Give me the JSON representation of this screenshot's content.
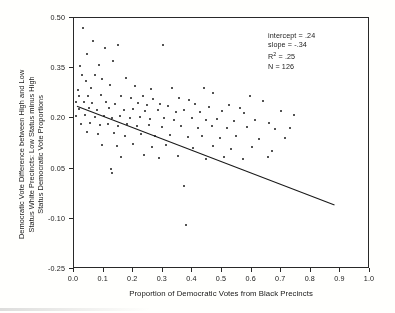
{
  "chart_data": {
    "type": "scatter",
    "title": "",
    "xlabel": "Proportion of Democratic Votes from Black Precincts",
    "ylabel": "Democratic Vote Difference between High and Low Status White Precincts: Low Status minus High Status Democratic Vote Proportions",
    "ylabel_lines": [
      "Democratic Vote Difference between High and Low",
      "Status White Precincts: Low Status minus High",
      "Status Democratic Vote Proportions"
    ],
    "xlim": [
      0.0,
      1.0
    ],
    "ylim": [
      -0.25,
      0.5
    ],
    "xticks": [
      0.0,
      0.1,
      0.2,
      0.3,
      0.4,
      0.5,
      0.6,
      0.7,
      0.8,
      0.9,
      1.0
    ],
    "xtick_labels": [
      "0.0",
      "0.1",
      "0.2",
      "0.3",
      "0.4",
      "0.5",
      "0.6",
      "0.7",
      "0.8",
      "0.9",
      "1.0"
    ],
    "yticks": [
      0.5,
      0.35,
      0.2,
      0.05,
      -0.1,
      -0.25
    ],
    "ytick_labels": [
      "0.50",
      "0.35",
      "0.20",
      "0.05",
      "-0.10",
      "-0.25"
    ],
    "grid": false,
    "legend": false,
    "marker_color": "#1b1b1b",
    "line_color": "#1b1b1b",
    "regression_line": {
      "intercept": 0.24,
      "slope": -0.34,
      "x_start": 0.01,
      "x_end": 0.88,
      "y_start": 0.236,
      "y_end": -0.059
    },
    "annotations": {
      "intercept_label": "intercept = .24",
      "slope_label": "slope = -.34",
      "r2_label_prefix": "R",
      "r2_label_sup": "2",
      "r2_label_suffix": " = .25",
      "n_label": "N = 126"
    },
    "n_points": 126,
    "points": [
      [
        0.03,
        0.47
      ],
      [
        0.045,
        0.392
      ],
      [
        0.065,
        0.432
      ],
      [
        0.105,
        0.41
      ],
      [
        0.15,
        0.418
      ],
      [
        0.3,
        0.418
      ],
      [
        0.02,
        0.356
      ],
      [
        0.085,
        0.36
      ],
      [
        0.132,
        0.372
      ],
      [
        0.026,
        0.33
      ],
      [
        0.07,
        0.33
      ],
      [
        0.04,
        0.312
      ],
      [
        0.096,
        0.318
      ],
      [
        0.175,
        0.322
      ],
      [
        0.122,
        0.3
      ],
      [
        0.205,
        0.296
      ],
      [
        0.012,
        0.286
      ],
      [
        0.057,
        0.29
      ],
      [
        0.26,
        0.288
      ],
      [
        0.33,
        0.29
      ],
      [
        0.438,
        0.292
      ],
      [
        0.47,
        0.276
      ],
      [
        0.018,
        0.268
      ],
      [
        0.048,
        0.266
      ],
      [
        0.09,
        0.27
      ],
      [
        0.16,
        0.268
      ],
      [
        0.192,
        0.262
      ],
      [
        0.232,
        0.268
      ],
      [
        0.268,
        0.258
      ],
      [
        0.355,
        0.262
      ],
      [
        0.39,
        0.256
      ],
      [
        0.596,
        0.268
      ],
      [
        0.64,
        0.252
      ],
      [
        0.008,
        0.248
      ],
      [
        0.034,
        0.25
      ],
      [
        0.062,
        0.246
      ],
      [
        0.108,
        0.248
      ],
      [
        0.14,
        0.244
      ],
      [
        0.215,
        0.246
      ],
      [
        0.248,
        0.24
      ],
      [
        0.292,
        0.244
      ],
      [
        0.318,
        0.236
      ],
      [
        0.41,
        0.242
      ],
      [
        0.455,
        0.234
      ],
      [
        0.525,
        0.24
      ],
      [
        0.56,
        0.23
      ],
      [
        0.016,
        0.228
      ],
      [
        0.052,
        0.232
      ],
      [
        0.078,
        0.226
      ],
      [
        0.118,
        0.23
      ],
      [
        0.168,
        0.224
      ],
      [
        0.2,
        0.228
      ],
      [
        0.24,
        0.222
      ],
      [
        0.285,
        0.226
      ],
      [
        0.345,
        0.22
      ],
      [
        0.372,
        0.224
      ],
      [
        0.425,
        0.218
      ],
      [
        0.5,
        0.222
      ],
      [
        0.575,
        0.216
      ],
      [
        0.7,
        0.222
      ],
      [
        0.742,
        0.21
      ],
      [
        0.006,
        0.206
      ],
      [
        0.038,
        0.21
      ],
      [
        0.072,
        0.204
      ],
      [
        0.1,
        0.208
      ],
      [
        0.128,
        0.202
      ],
      [
        0.156,
        0.206
      ],
      [
        0.188,
        0.2
      ],
      [
        0.222,
        0.204
      ],
      [
        0.258,
        0.198
      ],
      [
        0.305,
        0.202
      ],
      [
        0.338,
        0.196
      ],
      [
        0.398,
        0.2
      ],
      [
        0.445,
        0.194
      ],
      [
        0.482,
        0.198
      ],
      [
        0.54,
        0.192
      ],
      [
        0.612,
        0.196
      ],
      [
        0.66,
        0.186
      ],
      [
        0.024,
        0.182
      ],
      [
        0.055,
        0.186
      ],
      [
        0.088,
        0.18
      ],
      [
        0.115,
        0.184
      ],
      [
        0.148,
        0.178
      ],
      [
        0.18,
        0.182
      ],
      [
        0.212,
        0.176
      ],
      [
        0.252,
        0.18
      ],
      [
        0.296,
        0.174
      ],
      [
        0.362,
        0.178
      ],
      [
        0.418,
        0.172
      ],
      [
        0.465,
        0.176
      ],
      [
        0.518,
        0.17
      ],
      [
        0.585,
        0.174
      ],
      [
        0.68,
        0.168
      ],
      [
        0.73,
        0.172
      ],
      [
        0.044,
        0.158
      ],
      [
        0.082,
        0.152
      ],
      [
        0.136,
        0.156
      ],
      [
        0.172,
        0.148
      ],
      [
        0.228,
        0.152
      ],
      [
        0.275,
        0.146
      ],
      [
        0.325,
        0.15
      ],
      [
        0.385,
        0.144
      ],
      [
        0.432,
        0.148
      ],
      [
        0.492,
        0.142
      ],
      [
        0.548,
        0.146
      ],
      [
        0.625,
        0.138
      ],
      [
        0.712,
        0.142
      ],
      [
        0.095,
        0.122
      ],
      [
        0.145,
        0.118
      ],
      [
        0.198,
        0.124
      ],
      [
        0.262,
        0.116
      ],
      [
        0.312,
        0.12
      ],
      [
        0.402,
        0.112
      ],
      [
        0.47,
        0.118
      ],
      [
        0.532,
        0.11
      ],
      [
        0.6,
        0.116
      ],
      [
        0.668,
        0.104
      ],
      [
        0.16,
        0.086
      ],
      [
        0.235,
        0.09
      ],
      [
        0.288,
        0.082
      ],
      [
        0.35,
        0.088
      ],
      [
        0.445,
        0.08
      ],
      [
        0.508,
        0.086
      ],
      [
        0.572,
        0.078
      ],
      [
        0.655,
        0.084
      ],
      [
        0.125,
        0.048
      ],
      [
        0.128,
        0.038
      ],
      [
        0.37,
        -0.002
      ],
      [
        0.378,
        -0.118
      ]
    ]
  }
}
